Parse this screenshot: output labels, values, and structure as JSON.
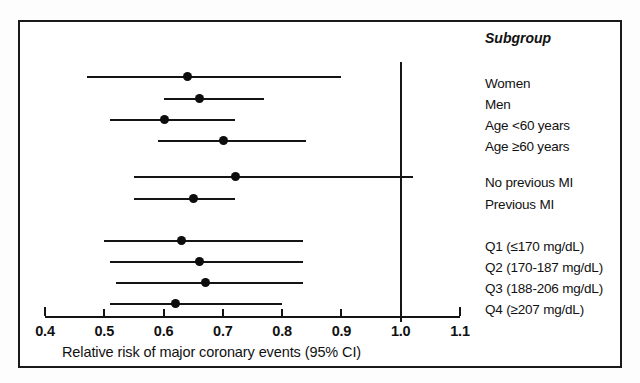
{
  "chart_data": {
    "type": "forest",
    "title": "",
    "xlabel": "Relative risk of major coronary events (95% CI)",
    "ylabel": "",
    "xlim": [
      0.4,
      1.1
    ],
    "xticks": [
      "0.4",
      "0.5",
      "0.6",
      "0.7",
      "0.8",
      "0.9",
      "1.0",
      "1.1"
    ],
    "xtick_values": [
      0.4,
      0.5,
      0.6,
      0.7,
      0.8,
      0.9,
      1.0,
      1.1
    ],
    "grid": false,
    "legend": "none",
    "reference_line": 1.0,
    "column_header": "Subgroup",
    "categories": [
      "Women",
      "Men",
      "Age <60 years",
      "Age ≥60 years",
      "No previous MI",
      "Previous MI",
      "Q1 (≤170 mg/dL)",
      "Q2 (170-187 mg/dL)",
      "Q3 (188-206 mg/dL)",
      "Q4 (≥207 mg/dL)"
    ],
    "values": [
      0.64,
      0.66,
      0.6,
      0.7,
      0.72,
      0.65,
      0.63,
      0.66,
      0.67,
      0.62
    ],
    "ci_low": [
      0.47,
      0.6,
      0.51,
      0.59,
      0.55,
      0.55,
      0.5,
      0.51,
      0.52,
      0.51
    ],
    "ci_high": [
      0.9,
      0.77,
      0.72,
      0.84,
      1.02,
      0.72,
      0.835,
      0.835,
      0.835,
      0.8
    ],
    "rows": [
      {
        "label": "Women",
        "estimate": 0.64,
        "low": 0.47,
        "high": 0.9,
        "group": 1
      },
      {
        "label": "Men",
        "estimate": 0.66,
        "low": 0.6,
        "high": 0.77,
        "group": 1
      },
      {
        "label": "Age <60 years",
        "estimate": 0.6,
        "low": 0.51,
        "high": 0.72,
        "group": 1
      },
      {
        "label": "Age ≥60 years",
        "estimate": 0.7,
        "low": 0.59,
        "high": 0.84,
        "group": 1
      },
      {
        "label": "No previous MI",
        "estimate": 0.72,
        "low": 0.55,
        "high": 1.02,
        "group": 2
      },
      {
        "label": "Previous MI",
        "estimate": 0.65,
        "low": 0.55,
        "high": 0.72,
        "group": 2
      },
      {
        "label": "Q1 (≤170 mg/dL)",
        "estimate": 0.63,
        "low": 0.5,
        "high": 0.835,
        "group": 3
      },
      {
        "label": "Q2 (170-187 mg/dL)",
        "estimate": 0.66,
        "low": 0.51,
        "high": 0.835,
        "group": 3
      },
      {
        "label": "Q3 (188-206 mg/dL)",
        "estimate": 0.67,
        "low": 0.52,
        "high": 0.835,
        "group": 3
      },
      {
        "label": "Q4 (≥207 mg/dL)",
        "estimate": 0.62,
        "low": 0.51,
        "high": 0.8,
        "group": 3
      }
    ]
  },
  "colors": {
    "ink": "#141414",
    "frame": "#1a1a1a",
    "background": "#ffffff"
  }
}
